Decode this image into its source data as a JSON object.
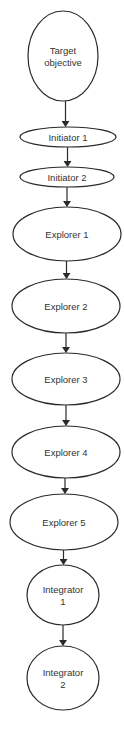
{
  "diagram": {
    "type": "flowchart",
    "direction": "top-to-bottom",
    "nodes": [
      {
        "id": "target",
        "lines": [
          "Target",
          "objective"
        ],
        "shape": "circle",
        "cx": 63,
        "cy": 56,
        "rx": 35,
        "ry": 45
      },
      {
        "id": "init1",
        "lines": [
          "Initiator 1"
        ],
        "shape": "ellipse",
        "cx": 68,
        "cy": 137,
        "rx": 48,
        "ry": 10
      },
      {
        "id": "init2",
        "lines": [
          "Initiator 2"
        ],
        "shape": "ellipse",
        "cx": 67,
        "cy": 177,
        "rx": 47,
        "ry": 10
      },
      {
        "id": "exp1",
        "lines": [
          "Explorer 1"
        ],
        "shape": "ellipse",
        "cx": 67,
        "cy": 234,
        "rx": 54,
        "ry": 27
      },
      {
        "id": "exp2",
        "lines": [
          "Explorer 2"
        ],
        "shape": "ellipse",
        "cx": 66,
        "cy": 306,
        "rx": 54,
        "ry": 27
      },
      {
        "id": "exp3",
        "lines": [
          "Explorer 3"
        ],
        "shape": "ellipse",
        "cx": 66,
        "cy": 379,
        "rx": 54,
        "ry": 26
      },
      {
        "id": "exp4",
        "lines": [
          "Explorer 4"
        ],
        "shape": "ellipse",
        "cx": 66,
        "cy": 452,
        "rx": 54,
        "ry": 26
      },
      {
        "id": "exp5",
        "lines": [
          "Explorer 5"
        ],
        "shape": "ellipse",
        "cx": 64,
        "cy": 522,
        "rx": 54,
        "ry": 28
      },
      {
        "id": "integ1",
        "lines": [
          "Integrator",
          "1"
        ],
        "shape": "circle",
        "cx": 63,
        "cy": 595,
        "rx": 36,
        "ry": 30
      },
      {
        "id": "integ2",
        "lines": [
          "Integrator",
          "2"
        ],
        "shape": "circle",
        "cx": 63,
        "cy": 678,
        "rx": 36,
        "ry": 32
      }
    ],
    "edges": [
      {
        "from": "target",
        "to": "init1"
      },
      {
        "from": "init1",
        "to": "init2"
      },
      {
        "from": "init2",
        "to": "exp1"
      },
      {
        "from": "exp1",
        "to": "exp2"
      },
      {
        "from": "exp2",
        "to": "exp3"
      },
      {
        "from": "exp3",
        "to": "exp4"
      },
      {
        "from": "exp4",
        "to": "exp5"
      },
      {
        "from": "exp5",
        "to": "integ1"
      },
      {
        "from": "integ1",
        "to": "integ2"
      }
    ],
    "colors": {
      "stroke": "#2a2a2a",
      "fill": "#ffffff",
      "text": "#333333"
    }
  }
}
